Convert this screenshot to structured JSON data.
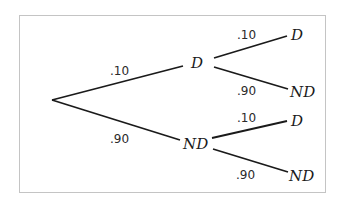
{
  "diagram": {
    "type": "probability-tree",
    "root": {
      "label": ""
    },
    "level1": [
      {
        "label": "D",
        "probability": ".10"
      },
      {
        "label": "ND",
        "probability": ".90"
      }
    ],
    "level2": [
      {
        "parent": "D",
        "label": "D",
        "probability": ".10"
      },
      {
        "parent": "D",
        "label": "ND",
        "probability": ".90"
      },
      {
        "parent": "ND",
        "label": "D",
        "probability": ".10"
      },
      {
        "parent": "ND",
        "label": "ND",
        "probability": ".90"
      }
    ]
  }
}
